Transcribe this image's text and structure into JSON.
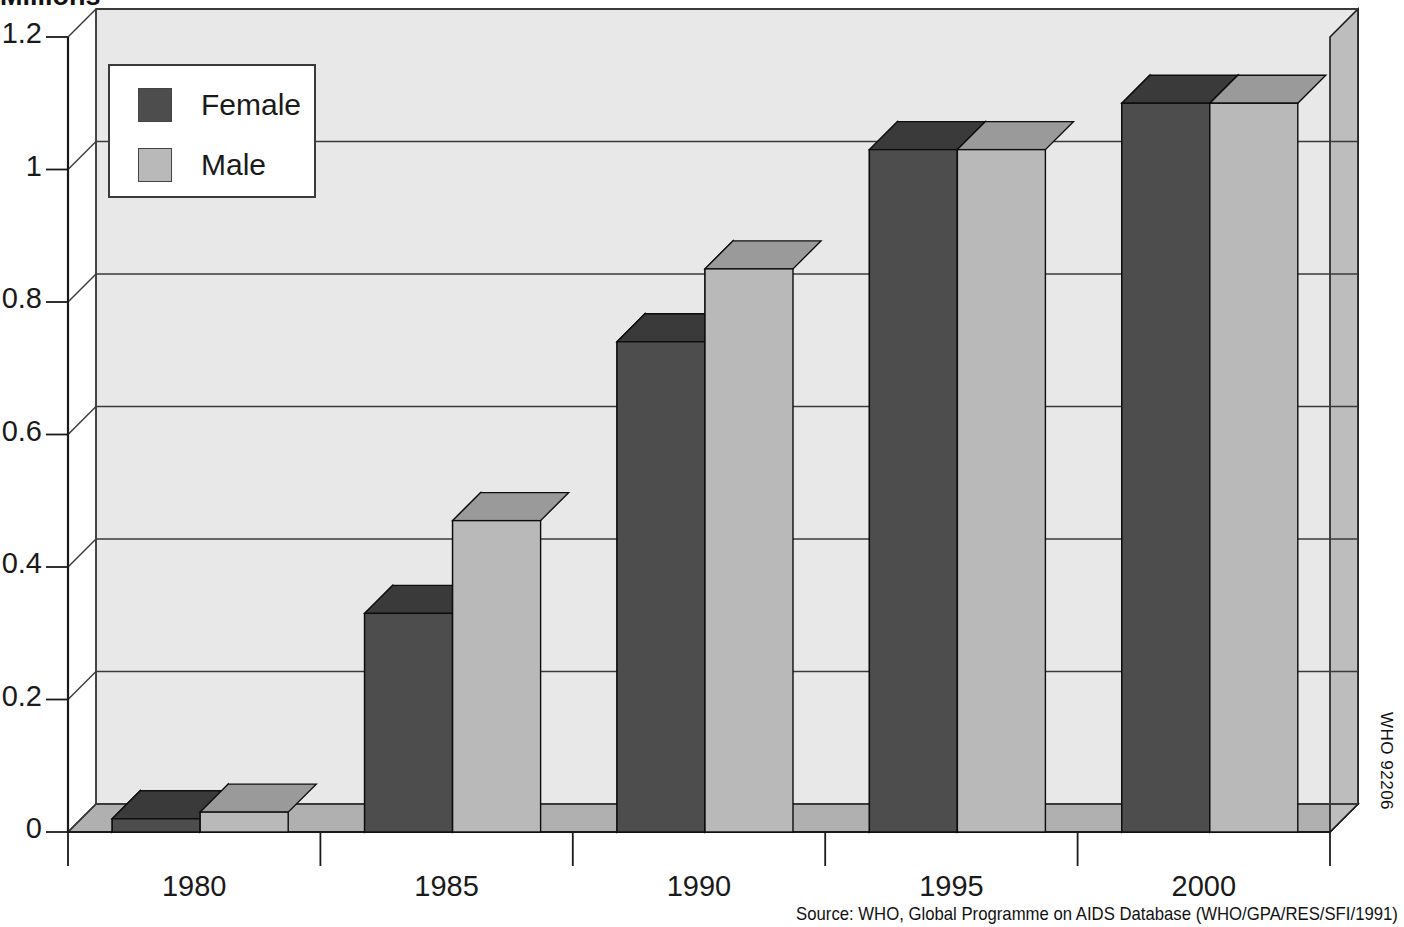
{
  "title": "Millions",
  "source_note": "Source: WHO, Global Programme on AIDS Database (WHO/GPA/RES/SFI/1991)",
  "who_code": "WHO 92206",
  "legend": {
    "position": "top-left-inside",
    "items": [
      {
        "label": "Female",
        "color": "#4d4d4d"
      },
      {
        "label": "Male",
        "color": "#b9b9b9"
      }
    ]
  },
  "colors": {
    "plot_background": "#e8e8e8",
    "wall_shade": "#bdbdbd",
    "floor_shade": "#b0b0b0",
    "female_front": "#4d4d4d",
    "female_side": "#1c1c1c",
    "female_top": "#3a3a3a",
    "male_front": "#b9b9b9",
    "male_side": "#1c1c1c",
    "male_top": "#9a9a9a",
    "gridline": "#3a3a3a",
    "axis": "#1a1a1a"
  },
  "chart_data": {
    "type": "bar",
    "title": "Millions",
    "xlabel": "",
    "ylabel": "Millions",
    "ylim": [
      0,
      1.2
    ],
    "yticks": [
      "0",
      "0.2",
      "0.4",
      "0.6",
      "0.8",
      "1",
      "1.2"
    ],
    "ytick_values": [
      0,
      0.2,
      0.4,
      0.6,
      0.8,
      1,
      1.2
    ],
    "categories": [
      "1980",
      "1985",
      "1990",
      "1995",
      "2000"
    ],
    "grid": true,
    "three_d": true,
    "legend_position": "upper left",
    "series": [
      {
        "name": "Female",
        "values": [
          0.02,
          0.33,
          0.74,
          1.03,
          1.1
        ]
      },
      {
        "name": "Male",
        "values": [
          0.03,
          0.47,
          0.85,
          1.03,
          1.1
        ]
      }
    ],
    "annotations": [
      "Source: WHO, Global Programme on AIDS Database (WHO/GPA/RES/SFI/1991)",
      "WHO 92206"
    ]
  }
}
